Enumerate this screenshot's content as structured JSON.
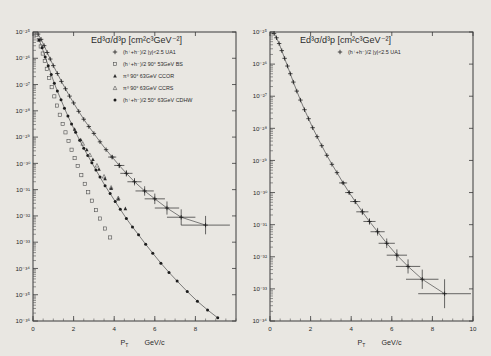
{
  "figure": {
    "background_color": "#e9e7e2",
    "axis_color": "#3a3a3a"
  },
  "chart_data": [
    {
      "id": "left",
      "type": "scatter",
      "title": "Ed³σ/d³p  [cm²c³GeV⁻²]",
      "xlabel": "P",
      "xlabel_sub": "T",
      "xlabel_unit": "GeV/c",
      "ylabel": "",
      "xlim": [
        0,
        10
      ],
      "ylim_exp": [
        -36,
        -25
      ],
      "xticks": [
        0,
        2,
        4,
        6,
        8
      ],
      "xticklabels": [
        "0",
        "2",
        "4",
        "6",
        "8"
      ],
      "yticks_exp": [
        -25,
        -26,
        -27,
        -28,
        -29,
        -30,
        -31,
        -32,
        -33,
        -34,
        -35,
        -36
      ],
      "yticklabels": [
        "10⁻²⁵",
        "10⁻²⁶",
        "10⁻²⁷",
        "10⁻²⁸",
        "10⁻²⁹",
        "10⁻³⁰",
        "10⁻³¹",
        "10⁻³²",
        "10⁻³³",
        "10⁻³⁴",
        "10⁻³⁵",
        "10⁻³⁶"
      ],
      "grid": false,
      "legend_position": "top-right",
      "legend": [
        {
          "marker": "cross",
          "label": "(h⁺+h⁻)/2     |y|<2.5  UA1"
        },
        {
          "marker": "open-square",
          "label": "(h⁺+h⁻)/2   90° 53GeV  BS"
        },
        {
          "marker": "triangle",
          "label": "π⁰  90°  63GeV  CCOR"
        },
        {
          "marker": "open-tri",
          "label": "π⁰  90°  63GeV  CCRS"
        },
        {
          "marker": "dot",
          "label": "(h⁺+h⁻)/2  50°  63GeV  CDHW"
        }
      ],
      "series": [
        {
          "name": "UA1 (h+ + h-)/2 |y|<2.5",
          "marker": "cross",
          "curve": true,
          "x": [
            0.25,
            0.4,
            0.55,
            0.7,
            0.85,
            1.0,
            1.2,
            1.4,
            1.6,
            1.8,
            2.0,
            2.25,
            2.5,
            2.75,
            3.0,
            3.3,
            3.6,
            3.9,
            4.25,
            4.6,
            5.0,
            5.5,
            6.0,
            6.6,
            7.3,
            8.5
          ],
          "y_exp": [
            -25.08,
            -25.28,
            -25.52,
            -25.78,
            -26.03,
            -26.28,
            -26.58,
            -26.88,
            -27.16,
            -27.44,
            -27.7,
            -28.02,
            -28.32,
            -28.6,
            -28.86,
            -29.18,
            -29.48,
            -29.76,
            -30.08,
            -30.38,
            -30.7,
            -31.05,
            -31.35,
            -31.7,
            -32.05,
            -32.35
          ],
          "xerr": [
            0,
            0,
            0,
            0,
            0,
            0,
            0,
            0,
            0,
            0,
            0,
            0,
            0,
            0,
            0,
            0,
            0,
            0.2,
            0.25,
            0.3,
            0.35,
            0.45,
            0.5,
            0.6,
            0.7,
            1.2
          ],
          "yerr_dex": [
            0,
            0,
            0,
            0,
            0,
            0,
            0,
            0,
            0,
            0,
            0,
            0,
            0,
            0,
            0,
            0,
            0,
            0.08,
            0.1,
            0.12,
            0.14,
            0.18,
            0.2,
            0.25,
            0.3,
            0.35
          ]
        },
        {
          "name": "BS (h+ + h-)/2 90° 53GeV",
          "marker": "open-square",
          "curve": false,
          "x": [
            0.18,
            0.28,
            0.38,
            0.48,
            0.58,
            0.68,
            0.8,
            0.92,
            1.05,
            1.18,
            1.32,
            1.46,
            1.6,
            1.75,
            1.9,
            2.05,
            2.2,
            2.38,
            2.55,
            2.72,
            2.9,
            3.1,
            3.3,
            3.55,
            3.8
          ],
          "y_exp": [
            -25.1,
            -25.3,
            -25.55,
            -25.82,
            -26.1,
            -26.4,
            -26.75,
            -27.1,
            -27.45,
            -27.8,
            -28.15,
            -28.5,
            -28.82,
            -29.15,
            -29.48,
            -29.8,
            -30.1,
            -30.45,
            -30.78,
            -31.1,
            -31.42,
            -31.78,
            -32.1,
            -32.48,
            -32.82
          ]
        },
        {
          "name": "CDHW (h+ + h-)/2 50° 63GeV",
          "marker": "dot",
          "curve": true,
          "x": [
            0.3,
            0.45,
            0.6,
            0.75,
            0.9,
            1.05,
            1.2,
            1.38,
            1.55,
            1.72,
            1.9,
            2.1,
            2.3,
            2.5,
            2.7,
            2.9,
            3.1,
            3.3,
            3.55,
            3.8,
            4.05,
            4.3,
            4.6,
            4.9,
            5.2,
            5.55,
            5.9,
            6.3,
            6.7,
            7.1,
            7.6,
            8.1,
            8.6,
            9.1
          ],
          "y_exp": [
            -25.3,
            -25.6,
            -25.95,
            -26.28,
            -26.62,
            -26.95,
            -27.25,
            -27.58,
            -27.9,
            -28.2,
            -28.5,
            -28.82,
            -29.12,
            -29.42,
            -29.7,
            -29.98,
            -30.25,
            -30.52,
            -30.85,
            -31.15,
            -31.45,
            -31.75,
            -32.1,
            -32.42,
            -32.72,
            -33.08,
            -33.42,
            -33.8,
            -34.15,
            -34.48,
            -34.88,
            -35.25,
            -35.58,
            -35.88
          ]
        },
        {
          "name": "CCOR π⁰ 90° 63GeV",
          "marker": "triangle",
          "curve": false,
          "x": [
            2.05,
            2.35,
            2.65,
            2.95,
            3.25,
            3.55,
            3.85,
            4.2,
            4.55
          ],
          "y_exp": [
            -28.7,
            -29.1,
            -29.48,
            -29.85,
            -30.22,
            -30.58,
            -30.95,
            -31.35,
            -31.72
          ]
        },
        {
          "name": "CCRS π⁰ 90° 63GeV",
          "marker": "open-tri",
          "curve": false,
          "x": [
            2.45,
            2.8,
            3.15,
            3.5,
            3.85,
            4.2
          ],
          "y_exp": [
            -29.25,
            -29.68,
            -30.08,
            -30.5,
            -30.92,
            -31.32
          ]
        }
      ]
    },
    {
      "id": "right",
      "type": "scatter",
      "title": "Ed³σ/d³p  [cm²c³GeV⁻²]",
      "xlabel": "P",
      "xlabel_sub": "T",
      "xlabel_unit": "GeV/c",
      "ylabel": "",
      "xlim": [
        0,
        10
      ],
      "ylim_exp": [
        -34,
        -25
      ],
      "xticks": [
        0,
        2,
        4,
        6,
        8,
        10
      ],
      "xticklabels": [
        "0",
        "2",
        "4",
        "6",
        "8",
        "10"
      ],
      "yticks_exp": [
        -25,
        -26,
        -27,
        -28,
        -29,
        -30,
        -31,
        -32,
        -33,
        -34
      ],
      "yticklabels": [
        "10⁻²⁵",
        "10⁻²⁶",
        "10⁻²⁷",
        "10⁻²⁸",
        "10⁻²⁹",
        "10⁻³⁰",
        "10⁻³¹",
        "10⁻³²",
        "10⁻³³",
        "10⁻³⁴"
      ],
      "grid": false,
      "legend_position": "top-right",
      "legend": [
        {
          "marker": "cross",
          "label": "(h⁺+h⁻)/2     |y|<2.5  UA1"
        }
      ],
      "series": [
        {
          "name": "UA1 (h+ + h-)/2 |y|<2.5",
          "marker": "cross",
          "curve": true,
          "x": [
            0.2,
            0.32,
            0.45,
            0.58,
            0.72,
            0.86,
            1.0,
            1.15,
            1.32,
            1.5,
            1.7,
            1.9,
            2.1,
            2.32,
            2.55,
            2.8,
            3.05,
            3.3,
            3.6,
            3.9,
            4.2,
            4.55,
            4.9,
            5.3,
            5.75,
            6.25,
            6.8,
            7.5,
            8.6
          ],
          "y_exp": [
            -25.05,
            -25.18,
            -25.36,
            -25.58,
            -25.82,
            -26.06,
            -26.3,
            -26.56,
            -26.84,
            -27.12,
            -27.42,
            -27.7,
            -27.98,
            -28.26,
            -28.54,
            -28.84,
            -29.12,
            -29.38,
            -29.7,
            -30.0,
            -30.28,
            -30.6,
            -30.9,
            -31.22,
            -31.58,
            -31.95,
            -32.3,
            -32.7,
            -33.15
          ],
          "xerr": [
            0,
            0,
            0,
            0,
            0,
            0,
            0,
            0,
            0,
            0,
            0,
            0,
            0,
            0,
            0,
            0,
            0,
            0,
            0.2,
            0.2,
            0.25,
            0.3,
            0.3,
            0.35,
            0.4,
            0.5,
            0.6,
            0.8,
            1.3
          ],
          "yerr_dex": [
            0,
            0,
            0,
            0,
            0,
            0,
            0,
            0,
            0,
            0,
            0,
            0,
            0,
            0,
            0,
            0,
            0,
            0,
            0.05,
            0.06,
            0.08,
            0.1,
            0.1,
            0.12,
            0.15,
            0.18,
            0.22,
            0.3,
            0.45
          ]
        }
      ]
    }
  ]
}
